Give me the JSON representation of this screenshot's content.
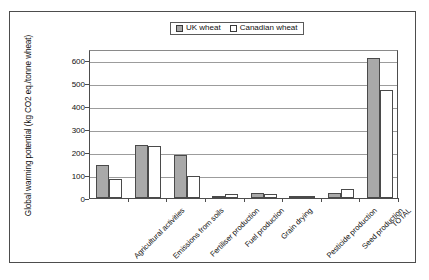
{
  "chart_data": {
    "type": "bar",
    "title": "",
    "xlabel": "",
    "ylabel": "Global warming potential (kg CO2 eq./tonne wheat)",
    "ylim": [
      0,
      650
    ],
    "yticks": [
      0,
      100,
      200,
      300,
      400,
      500,
      600
    ],
    "grid": true,
    "legend_position": "top-center",
    "categories": [
      "Agricultural activities",
      "Emissions from soils",
      "Fertiliser production",
      "Fuel production",
      "Grain drying",
      "Pesticide production",
      "Seed production",
      "TOTAL"
    ],
    "series": [
      {
        "name": "UK wheat",
        "color": "#a9a9a9",
        "pattern": "solid-grey",
        "values": [
          145,
          231,
          188,
          4,
          20,
          8,
          21,
          610
        ]
      },
      {
        "name": "Canadian wheat",
        "color": "#ffffff",
        "pattern": "dotted",
        "values": [
          83,
          228,
          97,
          16,
          19,
          4,
          38,
          473
        ]
      }
    ]
  },
  "legend": {
    "entries": [
      {
        "label": "UK wheat",
        "swatch": "filled-grey-swatch"
      },
      {
        "label": "Canadian wheat",
        "swatch": "dotted-white-swatch"
      }
    ]
  },
  "axis": {
    "y_title": "Global warming potential (kg CO2 eq./tonne wheat)",
    "y_tick_labels": [
      "600",
      "500",
      "400",
      "300",
      "200",
      "100",
      "0"
    ]
  }
}
